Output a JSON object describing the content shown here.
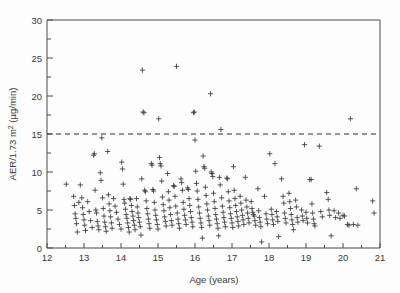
{
  "figure": {
    "background_color": "#fdfdfd",
    "frame_color": "#4a4a4a",
    "marker_color": "#3b3b3b",
    "threshold_color": "#2f2f2f"
  },
  "axes": {
    "x_title": "Age (years)",
    "y_title_main": "AER/1.73 m",
    "y_title_sup": "2",
    "y_title_unit": " (µg/min)",
    "x_ticks": [
      "12",
      "13",
      "14",
      "15",
      "16",
      "17",
      "18",
      "19",
      "20",
      "21"
    ],
    "y_ticks": [
      "0",
      "5",
      "10",
      "15",
      "20",
      "25",
      "30"
    ]
  },
  "chart_data": {
    "type": "scatter",
    "title": "",
    "xlabel": "Age (years)",
    "ylabel": "AER/1.73 m2 (µg/min)",
    "xlim": [
      12,
      21
    ],
    "ylim": [
      0,
      30
    ],
    "xticks": [
      12,
      13,
      14,
      15,
      16,
      17,
      18,
      19,
      20,
      21
    ],
    "yticks": [
      0,
      5,
      10,
      15,
      20,
      25,
      30
    ],
    "x_minor_tick_interval": 0.5,
    "y_minor_tick_interval": 2.5,
    "grid": false,
    "legend": false,
    "marker": "plus",
    "marker_size": 4,
    "annotations": [
      {
        "type": "hline",
        "y": 15,
        "style": "dashed",
        "label": "microalbuminuria threshold 15 µg/min"
      }
    ],
    "series": [
      {
        "name": "AER measurements",
        "points": [
          [
            12.52,
            8.4
          ],
          [
            12.72,
            6.8
          ],
          [
            12.74,
            5.6
          ],
          [
            12.76,
            4.5
          ],
          [
            12.78,
            3.9
          ],
          [
            12.8,
            3.2
          ],
          [
            12.82,
            2.1
          ],
          [
            12.86,
            6.0
          ],
          [
            12.9,
            8.3
          ],
          [
            12.94,
            6.6
          ],
          [
            12.96,
            5.3
          ],
          [
            12.98,
            4.4
          ],
          [
            13.0,
            3.7
          ],
          [
            13.02,
            3.0
          ],
          [
            13.04,
            2.3
          ],
          [
            13.1,
            6.1
          ],
          [
            13.14,
            4.8
          ],
          [
            13.18,
            3.6
          ],
          [
            13.22,
            2.7
          ],
          [
            13.26,
            12.2
          ],
          [
            13.28,
            12.4
          ],
          [
            13.3,
            7.6
          ],
          [
            13.32,
            5.0
          ],
          [
            13.34,
            4.6
          ],
          [
            13.36,
            3.5
          ],
          [
            13.38,
            2.9
          ],
          [
            13.4,
            2.4
          ],
          [
            13.44,
            9.9
          ],
          [
            13.46,
            8.9
          ],
          [
            13.48,
            14.5
          ],
          [
            13.5,
            6.6
          ],
          [
            13.52,
            5.2
          ],
          [
            13.54,
            4.2
          ],
          [
            13.56,
            3.4
          ],
          [
            13.58,
            2.8
          ],
          [
            13.6,
            2.2
          ],
          [
            13.64,
            12.7
          ],
          [
            13.66,
            7.0
          ],
          [
            13.68,
            5.8
          ],
          [
            13.7,
            4.9
          ],
          [
            13.72,
            4.1
          ],
          [
            13.74,
            3.3
          ],
          [
            13.76,
            2.6
          ],
          [
            13.8,
            6.5
          ],
          [
            13.84,
            5.5
          ],
          [
            13.88,
            4.7
          ],
          [
            13.92,
            3.8
          ],
          [
            13.96,
            3.1
          ],
          [
            14.0,
            2.5
          ],
          [
            14.02,
            11.3
          ],
          [
            14.04,
            10.4
          ],
          [
            14.06,
            8.4
          ],
          [
            14.08,
            6.4
          ],
          [
            14.1,
            5.9
          ],
          [
            14.12,
            5.1
          ],
          [
            14.14,
            4.4
          ],
          [
            14.16,
            3.9
          ],
          [
            14.18,
            3.3
          ],
          [
            14.2,
            2.7
          ],
          [
            14.22,
            2.1
          ],
          [
            14.24,
            6.5
          ],
          [
            14.26,
            6.4
          ],
          [
            14.28,
            5.6
          ],
          [
            14.3,
            4.8
          ],
          [
            14.32,
            4.2
          ],
          [
            14.34,
            3.6
          ],
          [
            14.36,
            3.0
          ],
          [
            14.38,
            2.4
          ],
          [
            14.42,
            6.5
          ],
          [
            14.44,
            5.4
          ],
          [
            14.46,
            4.6
          ],
          [
            14.48,
            4.0
          ],
          [
            14.5,
            3.4
          ],
          [
            14.52,
            2.8
          ],
          [
            14.54,
            1.7
          ],
          [
            14.56,
            9.1
          ],
          [
            14.58,
            23.4
          ],
          [
            14.6,
            17.9
          ],
          [
            14.62,
            17.8
          ],
          [
            14.64,
            7.6
          ],
          [
            14.66,
            7.4
          ],
          [
            14.68,
            6.2
          ],
          [
            14.7,
            5.2
          ],
          [
            14.72,
            4.5
          ],
          [
            14.74,
            3.8
          ],
          [
            14.76,
            3.2
          ],
          [
            14.78,
            2.6
          ],
          [
            14.82,
            11.1
          ],
          [
            14.84,
            10.9
          ],
          [
            14.86,
            7.7
          ],
          [
            14.88,
            7.5
          ],
          [
            14.9,
            6.0
          ],
          [
            14.92,
            5.0
          ],
          [
            14.94,
            4.3
          ],
          [
            14.96,
            3.7
          ],
          [
            14.98,
            3.1
          ],
          [
            15.0,
            2.5
          ],
          [
            15.02,
            17.0
          ],
          [
            15.04,
            11.9
          ],
          [
            15.06,
            11.1
          ],
          [
            15.08,
            10.8
          ],
          [
            15.1,
            8.8
          ],
          [
            15.12,
            6.7
          ],
          [
            15.14,
            5.7
          ],
          [
            15.16,
            4.9
          ],
          [
            15.18,
            4.1
          ],
          [
            15.2,
            3.5
          ],
          [
            15.22,
            2.9
          ],
          [
            15.26,
            9.8
          ],
          [
            15.28,
            7.4
          ],
          [
            15.3,
            6.3
          ],
          [
            15.32,
            5.3
          ],
          [
            15.34,
            4.4
          ],
          [
            15.36,
            3.6
          ],
          [
            15.38,
            3.0
          ],
          [
            15.42,
            8.2
          ],
          [
            15.44,
            8.1
          ],
          [
            15.46,
            6.8
          ],
          [
            15.48,
            5.5
          ],
          [
            15.5,
            23.9
          ],
          [
            15.52,
            4.6
          ],
          [
            15.54,
            3.8
          ],
          [
            15.56,
            3.2
          ],
          [
            15.58,
            2.6
          ],
          [
            15.62,
            9.1
          ],
          [
            15.64,
            8.6
          ],
          [
            15.66,
            7.6
          ],
          [
            15.68,
            6.0
          ],
          [
            15.7,
            5.1
          ],
          [
            15.72,
            4.3
          ],
          [
            15.74,
            3.7
          ],
          [
            15.76,
            3.1
          ],
          [
            15.8,
            7.9
          ],
          [
            15.82,
            7.7
          ],
          [
            15.84,
            6.5
          ],
          [
            15.86,
            5.6
          ],
          [
            15.88,
            4.8
          ],
          [
            15.9,
            4.0
          ],
          [
            15.92,
            3.4
          ],
          [
            15.94,
            2.8
          ],
          [
            15.96,
            17.8
          ],
          [
            15.98,
            17.9
          ],
          [
            16.0,
            14.2
          ],
          [
            16.02,
            10.1
          ],
          [
            16.04,
            8.5
          ],
          [
            16.06,
            7.5
          ],
          [
            16.08,
            6.4
          ],
          [
            16.1,
            5.4
          ],
          [
            16.12,
            4.6
          ],
          [
            16.14,
            3.9
          ],
          [
            16.16,
            3.3
          ],
          [
            16.18,
            2.7
          ],
          [
            16.2,
            1.3
          ],
          [
            16.22,
            12.1
          ],
          [
            16.24,
            10.7
          ],
          [
            16.26,
            10.5
          ],
          [
            16.28,
            8.0
          ],
          [
            16.3,
            6.9
          ],
          [
            16.32,
            5.8
          ],
          [
            16.34,
            5.0
          ],
          [
            16.36,
            4.2
          ],
          [
            16.38,
            3.6
          ],
          [
            16.4,
            3.0
          ],
          [
            16.42,
            20.3
          ],
          [
            16.44,
            10.0
          ],
          [
            16.46,
            9.8
          ],
          [
            16.48,
            9.4
          ],
          [
            16.5,
            7.2
          ],
          [
            16.52,
            6.1
          ],
          [
            16.54,
            5.2
          ],
          [
            16.56,
            4.4
          ],
          [
            16.58,
            3.8
          ],
          [
            16.6,
            3.2
          ],
          [
            16.62,
            2.6
          ],
          [
            16.64,
            1.6
          ],
          [
            16.66,
            9.3
          ],
          [
            16.68,
            8.3
          ],
          [
            16.7,
            15.6
          ],
          [
            16.72,
            6.6
          ],
          [
            16.74,
            5.5
          ],
          [
            16.76,
            4.7
          ],
          [
            16.78,
            4.0
          ],
          [
            16.8,
            3.4
          ],
          [
            16.82,
            2.8
          ],
          [
            16.86,
            9.2
          ],
          [
            16.88,
            9.1
          ],
          [
            16.9,
            7.4
          ],
          [
            16.92,
            6.2
          ],
          [
            16.94,
            5.3
          ],
          [
            16.96,
            4.5
          ],
          [
            16.98,
            3.9
          ],
          [
            17.0,
            3.3
          ],
          [
            17.02,
            2.7
          ],
          [
            17.04,
            10.7
          ],
          [
            17.06,
            7.6
          ],
          [
            17.08,
            6.5
          ],
          [
            17.1,
            5.6
          ],
          [
            17.12,
            4.8
          ],
          [
            17.14,
            4.1
          ],
          [
            17.16,
            3.5
          ],
          [
            17.18,
            2.9
          ],
          [
            17.22,
            6.8
          ],
          [
            17.24,
            5.9
          ],
          [
            17.26,
            5.0
          ],
          [
            17.28,
            4.3
          ],
          [
            17.3,
            3.7
          ],
          [
            17.32,
            3.1
          ],
          [
            17.36,
            9.3
          ],
          [
            17.38,
            6.3
          ],
          [
            17.4,
            5.4
          ],
          [
            17.42,
            4.6
          ],
          [
            17.44,
            3.9
          ],
          [
            17.46,
            3.3
          ],
          [
            17.52,
            6.1
          ],
          [
            17.54,
            5.2
          ],
          [
            17.56,
            4.7
          ],
          [
            17.58,
            4.4
          ],
          [
            17.6,
            4.2
          ],
          [
            17.62,
            3.6
          ],
          [
            17.64,
            3.0
          ],
          [
            17.7,
            7.8
          ],
          [
            17.72,
            4.9
          ],
          [
            17.74,
            4.0
          ],
          [
            17.76,
            3.4
          ],
          [
            17.78,
            2.8
          ],
          [
            17.8,
            0.8
          ],
          [
            17.88,
            6.8
          ],
          [
            17.92,
            4.5
          ],
          [
            17.94,
            3.8
          ],
          [
            17.96,
            3.2
          ],
          [
            18.02,
            12.4
          ],
          [
            18.06,
            5.1
          ],
          [
            18.08,
            4.4
          ],
          [
            18.1,
            3.7
          ],
          [
            18.12,
            3.1
          ],
          [
            18.16,
            11.1
          ],
          [
            18.2,
            4.8
          ],
          [
            18.22,
            4.1
          ],
          [
            18.24,
            3.5
          ],
          [
            18.26,
            1.5
          ],
          [
            18.34,
            9.1
          ],
          [
            18.38,
            6.8
          ],
          [
            18.4,
            5.9
          ],
          [
            18.42,
            4.6
          ],
          [
            18.44,
            3.9
          ],
          [
            18.46,
            3.3
          ],
          [
            18.54,
            7.2
          ],
          [
            18.56,
            6.1
          ],
          [
            18.58,
            5.2
          ],
          [
            18.6,
            4.4
          ],
          [
            18.62,
            3.7
          ],
          [
            18.64,
            3.1
          ],
          [
            18.66,
            2.4
          ],
          [
            18.72,
            6.3
          ],
          [
            18.74,
            5.4
          ],
          [
            18.76,
            4.0
          ],
          [
            18.78,
            3.4
          ],
          [
            18.88,
            5.0
          ],
          [
            18.9,
            4.2
          ],
          [
            18.92,
            3.6
          ],
          [
            18.96,
            13.6
          ],
          [
            19.0,
            4.7
          ],
          [
            19.02,
            3.9
          ],
          [
            19.04,
            3.3
          ],
          [
            19.1,
            9.0
          ],
          [
            19.14,
            9.0
          ],
          [
            19.16,
            5.8
          ],
          [
            19.18,
            4.6
          ],
          [
            19.2,
            3.8
          ],
          [
            19.22,
            3.2
          ],
          [
            19.24,
            2.9
          ],
          [
            19.36,
            13.4
          ],
          [
            19.4,
            4.8
          ],
          [
            19.44,
            4.1
          ],
          [
            19.56,
            7.3
          ],
          [
            19.6,
            6.4
          ],
          [
            19.62,
            5.0
          ],
          [
            19.64,
            4.3
          ],
          [
            19.68,
            1.6
          ],
          [
            19.76,
            4.9
          ],
          [
            19.8,
            4.0
          ],
          [
            19.88,
            4.6
          ],
          [
            19.92,
            3.9
          ],
          [
            20.0,
            4.3
          ],
          [
            20.04,
            4.2
          ],
          [
            20.12,
            3.1
          ],
          [
            20.16,
            3.0
          ],
          [
            20.2,
            17.0
          ],
          [
            20.28,
            3.1
          ],
          [
            20.36,
            7.8
          ],
          [
            20.4,
            3.0
          ],
          [
            20.8,
            6.2
          ],
          [
            20.84,
            4.6
          ]
        ]
      }
    ]
  }
}
